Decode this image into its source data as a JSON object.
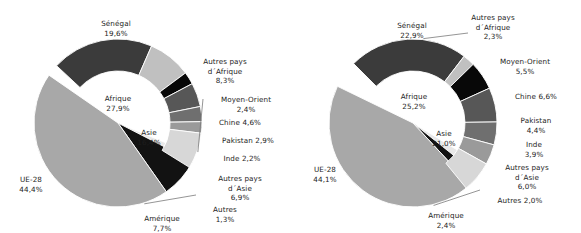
{
  "chart_data": [
    {
      "type": "pie",
      "id": "chart-left",
      "title": "",
      "legend": "none",
      "inner_ring": {
        "categories": [
          "UE-28",
          "Afrique",
          "Asie",
          "Amérique",
          "Autres"
        ],
        "values": [
          44.4,
          27.9,
          16.4,
          7.7,
          1.3
        ],
        "value_labels": [
          "44,4%",
          "27,9%",
          "16,4%",
          "7,7%",
          "1,3%"
        ],
        "colors": [
          "#a8a8a8",
          "#ffffff",
          "#ffffff",
          "#121212",
          "#e8e8e8"
        ]
      },
      "outer_ring": {
        "categories": [
          "Sénégal",
          "Autres pays d´Afrique",
          "Moyen-Orient",
          "Chine",
          "Pakistan",
          "Inde",
          "Autres pays d´Asie"
        ],
        "values": [
          19.6,
          8.3,
          2.4,
          4.6,
          2.9,
          2.2,
          6.9
        ],
        "value_labels": [
          "19,6%",
          "8,3%",
          "2,4%",
          "4,6%",
          "2,9%",
          "2,2%",
          "6,9%"
        ],
        "colors": [
          "#3b3b3b",
          "#c0c0c0",
          "#080808",
          "#575757",
          "#6f6f6f",
          "#9a9a9a",
          "#d7d7d7"
        ]
      }
    },
    {
      "type": "pie",
      "id": "chart-right",
      "title": "",
      "legend": "none",
      "inner_ring": {
        "categories": [
          "UE-28",
          "Afrique",
          "Asie",
          "Amérique",
          "Autres"
        ],
        "values": [
          44.1,
          25.2,
          21.0,
          2.4,
          2.0
        ],
        "value_labels": [
          "44,1%",
          "25,2%",
          "21,0%",
          "2,4%",
          "2,0%"
        ],
        "colors": [
          "#a8a8a8",
          "#ffffff",
          "#ffffff",
          "#121212",
          "#e8e8e8"
        ]
      },
      "outer_ring": {
        "categories": [
          "Sénégal",
          "Autres pays d´Afrique",
          "Moyen-Orient",
          "Chine",
          "Pakistan",
          "Inde",
          "Autres pays d´Asie"
        ],
        "values": [
          22.9,
          2.3,
          5.5,
          6.6,
          4.4,
          3.9,
          6.0
        ],
        "value_labels": [
          "22,9%",
          "2,3%",
          "5,5%",
          "6,6%",
          "4,4%",
          "3,9%",
          "6,0%"
        ],
        "colors": [
          "#3b3b3b",
          "#c0c0c0",
          "#080808",
          "#575757",
          "#6f6f6f",
          "#9a9a9a",
          "#d7d7d7"
        ]
      }
    }
  ],
  "left": {
    "senegal": {
      "name": "Sénégal",
      "value": "19,6%"
    },
    "autres_afrique": {
      "name": "Autres pays\nd´Afrique",
      "value": "8,3%"
    },
    "moyen_orient": {
      "name": "Moyen-Orient",
      "value": "2,4%"
    },
    "chine": {
      "name": "Chine  4,6%",
      "value": ""
    },
    "pakistan": {
      "name": "Pakistan 2,9%",
      "value": ""
    },
    "inde": {
      "name": "Inde 2,2%",
      "value": ""
    },
    "autres_asie": {
      "name": "Autres pays\nd´Asie",
      "value": "6,9%"
    },
    "autres": {
      "name": "Autres",
      "value": "1,3%"
    },
    "amerique": {
      "name": "Amérique",
      "value": "7,7%"
    },
    "ue28": {
      "name": "UE-28",
      "value": "44,4%"
    },
    "afrique": {
      "name": "Afrique",
      "value": "27,9%"
    },
    "asie": {
      "name": "Asie",
      "value": "16,4%"
    }
  },
  "right": {
    "senegal": {
      "name": "Sénégal",
      "value": "22,9%"
    },
    "autres_afrique": {
      "name": "Autres pays\nd´Afrique",
      "value": "2,3%"
    },
    "moyen_orient": {
      "name": "Moyen-Orient",
      "value": "5,5%"
    },
    "chine": {
      "name": "Chine  6,6%",
      "value": ""
    },
    "pakistan": {
      "name": "Pakistan",
      "value": "4,4%"
    },
    "inde": {
      "name": "Inde",
      "value": "3,9%"
    },
    "autres_asie": {
      "name": "Autres pays\nd´Asie",
      "value": "6,0%"
    },
    "autres": {
      "name": "Autres 2,0%",
      "value": ""
    },
    "amerique": {
      "name": "Amérique",
      "value": "2,4%"
    },
    "ue28": {
      "name": "UE-28",
      "value": "44,1%"
    },
    "afrique": {
      "name": "Afrique",
      "value": "25,2%"
    },
    "asie": {
      "name": "Asie",
      "value": "21,0%"
    }
  }
}
